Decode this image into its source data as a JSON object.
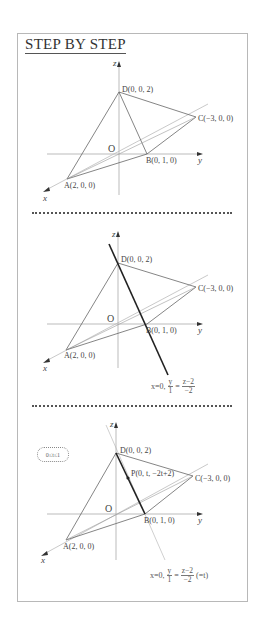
{
  "header": {
    "title": "STEP BY STEP"
  },
  "axes": {
    "x": "x",
    "y": "y",
    "z": "z",
    "origin": "O"
  },
  "points": {
    "A": "A(2, 0, 0)",
    "B": "B(0, 1, 0)",
    "C": "C(−3, 0, 0)",
    "D": "D(0, 0, 2)",
    "P": "P(0, t, −2t+2)"
  },
  "panels": [
    {
      "step": 1,
      "description": "Tetrahedron ABCD with coordinates"
    },
    {
      "step": 2,
      "description": "Line through D and B",
      "formula": {
        "prefix": "x=0,",
        "frac1_num": "y",
        "frac1_den": "1",
        "eq": "=",
        "frac2_num": "z−2",
        "frac2_den": "−2"
      }
    },
    {
      "step": 3,
      "description": "Point P on segment DB",
      "range_note": "0≤t≤1",
      "formula": {
        "prefix": "x=0,",
        "frac1_num": "y",
        "frac1_den": "1",
        "eq": "=",
        "frac2_num": "z−2",
        "frac2_den": "−2",
        "suffix": "(=t)"
      }
    }
  ],
  "colors": {
    "frame": "#b8b8b8",
    "line": "#555555",
    "axis": "#999999",
    "highlight": "#222222",
    "faint": "#cccccc"
  }
}
